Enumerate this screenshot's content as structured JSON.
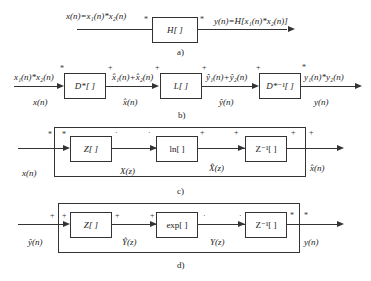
{
  "diagrams": {
    "a": {
      "caption": "a)",
      "input_label": "x(n)=x₁(n)*x₂(n)",
      "block": "H[ ]",
      "output_label": "y(n)=H[x₁(n)*x₂(n)]",
      "in_sym": "*",
      "out_sym": "*"
    },
    "b": {
      "caption": "b)",
      "input_top": "x₁(n)*x₂(n)",
      "input_bottom": "x(n)",
      "blocks": [
        "D*[ ]",
        "L[ ]",
        "D*⁻¹[ ]"
      ],
      "mid1_top": "x̂₁(n)+x̂₂(n)",
      "mid1_bottom": "x̂(n)",
      "mid2_top": "ŷ₁(n)+ŷ₂(n)",
      "mid2_bottom": "ŷ(n)",
      "output_top": "y₁(n)*y₂(n)",
      "output_bottom": "y(n)",
      "syms": [
        "*",
        "+",
        "+",
        "+",
        "+",
        "*"
      ]
    },
    "c": {
      "caption": "c)",
      "input": "x(n)",
      "blocks": [
        "Z[ ]",
        "ln[ ]",
        "Z⁻¹[ ]"
      ],
      "mid1": "X(z)",
      "mid2": "X̂(z)",
      "output": "x̂(n)",
      "syms": [
        "*",
        "*",
        "·",
        "·",
        "+",
        "+",
        "+",
        "+"
      ]
    },
    "d": {
      "caption": "d)",
      "input": "ŷ(n)",
      "blocks": [
        "Z[ ]",
        "exp[ ]",
        "Z⁻¹[ ]"
      ],
      "mid1": "Ŷ(z)",
      "mid2": "Y(z)",
      "output": "y(n)",
      "syms": [
        "+",
        "+",
        "+",
        "+",
        "·",
        "·",
        "*",
        "*"
      ]
    }
  }
}
